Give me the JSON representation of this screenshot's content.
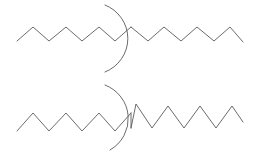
{
  "figure": {
    "type": "line-diagram",
    "width": 260,
    "height": 160,
    "background_color": "#ffffff",
    "stroke_color": "#5a5a5a",
    "stroke_width": 0.9
  },
  "chart_data": {
    "type": "line",
    "title": "",
    "subtitle": "",
    "xlabel": "",
    "ylabel": "",
    "grid": false,
    "legend": null,
    "axis_visible": false,
    "tick_labels": [],
    "annotations": [],
    "xlim": [
      0,
      260
    ],
    "ylim": [
      0,
      160
    ],
    "series": [
      {
        "name": "top-zigzag-left",
        "type": "polyline",
        "points": [
          [
            17,
            41
          ],
          [
            33,
            27
          ],
          [
            49,
            41
          ],
          [
            66,
            27
          ],
          [
            82,
            41
          ],
          [
            99,
            27
          ],
          [
            115,
            41
          ],
          [
            131,
            27
          ]
        ]
      },
      {
        "name": "top-zigzag-right",
        "type": "polyline",
        "points": [
          [
            131,
            27
          ],
          [
            148,
            41
          ],
          [
            164,
            27
          ],
          [
            181,
            41
          ],
          [
            197,
            27
          ],
          [
            214,
            41
          ],
          [
            230,
            27
          ],
          [
            243,
            42
          ]
        ]
      },
      {
        "name": "top-arc",
        "type": "arc",
        "start": [
          105,
          5
        ],
        "end": [
          105,
          72
        ],
        "radius": 36,
        "sweep": 1,
        "large_arc": 0,
        "bulge_direction": "right",
        "rightmost_x": 139
      },
      {
        "name": "bottom-zigzag-left",
        "type": "polyline",
        "points": [
          [
            17,
            131
          ],
          [
            33,
            113
          ],
          [
            49,
            131
          ],
          [
            66,
            113
          ],
          [
            82,
            131
          ],
          [
            99,
            113
          ],
          [
            115,
            131
          ],
          [
            131,
            113
          ]
        ]
      },
      {
        "name": "bottom-connector",
        "type": "polyline",
        "points": [
          [
            131,
            113
          ],
          [
            131,
            128
          ]
        ]
      },
      {
        "name": "bottom-zigzag-right",
        "type": "polyline",
        "points": [
          [
            131,
            128
          ],
          [
            136,
            104
          ],
          [
            152,
            128
          ],
          [
            168,
            106
          ],
          [
            184,
            128
          ],
          [
            200,
            106
          ],
          [
            216,
            128
          ],
          [
            232,
            106
          ],
          [
            243,
            122
          ]
        ]
      },
      {
        "name": "bottom-arc",
        "type": "arc",
        "start": [
          105,
          85
        ],
        "end": [
          110,
          150
        ],
        "radius": 36,
        "sweep": 1,
        "large_arc": 0,
        "bulge_direction": "right",
        "rightmost_x": 142
      }
    ]
  },
  "elements": {
    "top_group_label": "top-waveform-group",
    "bottom_group_label": "bottom-waveform-group"
  }
}
